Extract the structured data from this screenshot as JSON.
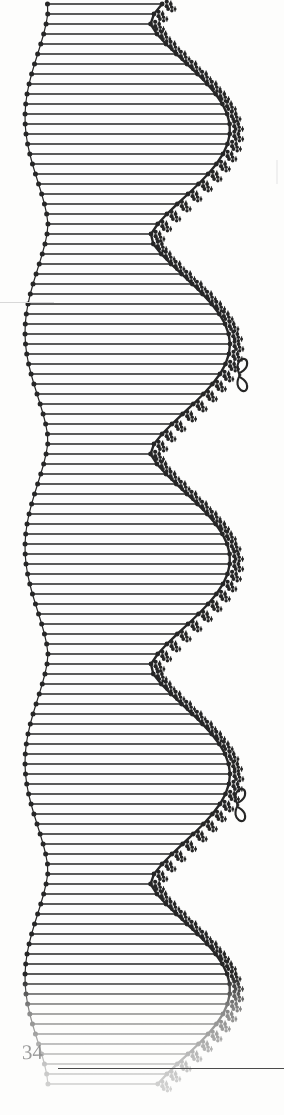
{
  "page": {
    "folio": "34",
    "background_color": "#fdfdfc",
    "ink_color": "#262626",
    "faded_ink_color": "#b4b4b4",
    "width": 284,
    "height": 1115
  },
  "plate": {
    "title": "",
    "description": "Decorative engraved band of horizontal hatching lines with scalloped beaded left edge and trefoil-sprig right edge",
    "line_spacing": 10,
    "line_count": 110,
    "left_edge_style": "beaded-scallop",
    "right_edge_style": "trefoil-sprig",
    "fade_start_y": 985,
    "ornaments": [
      {
        "name": "figure-eight-knot",
        "x": 240,
        "y": 375
      },
      {
        "name": "figure-eight-knot",
        "x": 238,
        "y": 805
      }
    ],
    "wave": {
      "period": 215,
      "left_neck_x": 48,
      "left_bulge_x": 25,
      "right_neck_x": 150,
      "right_bulge_x": 230,
      "neck_offsets_y": [
        10,
        225,
        440,
        655,
        870,
        1085
      ]
    }
  },
  "rule": {
    "name": "footer-rule",
    "x": 58,
    "y": 1068,
    "width": 226,
    "color": "#4a4a4a"
  },
  "chart_data": {
    "type": "line",
    "xlabel": "",
    "ylabel": "",
    "series": [
      {
        "name": "left-boundary",
        "values": [
          48,
          25,
          48,
          25,
          48,
          25
        ]
      },
      {
        "name": "right-boundary",
        "values": [
          150,
          230,
          150,
          230,
          150,
          230
        ]
      }
    ],
    "categories": [
      "10",
      "225",
      "440",
      "655",
      "870",
      "1085"
    ]
  }
}
